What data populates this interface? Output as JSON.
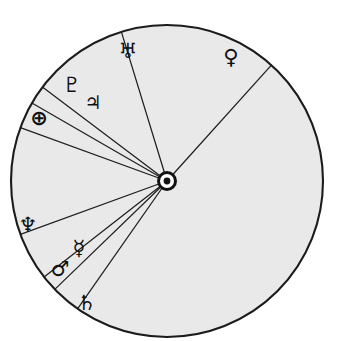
{
  "figure": {
    "hub_label": "Sun",
    "hub_symbol": "☉",
    "background_color": "#ffffff",
    "disc_fill_color": "#e9e9e9",
    "outline_color": "#1b1b1b",
    "glyph_color": "#101010"
  },
  "geometry": {
    "center_x": 167,
    "center_y": 181,
    "radius": 156,
    "units": "pixels"
  },
  "chart_data": {
    "type": "pie",
    "xlabel": "",
    "ylabel": "",
    "legend_position": "on-slice",
    "grid": false,
    "angle_units": "degrees-clockwise-from-top",
    "categories": [
      "Venus",
      "Uranus",
      "Pluto",
      "Jupiter",
      "Earth",
      "Neptune",
      "Mercury",
      "Mars",
      "Saturn"
    ],
    "symbols": [
      "♀",
      "♅",
      "♇",
      "♃",
      "⊕",
      "♆",
      "☿",
      "♂",
      "♄"
    ],
    "boundary_angles": [
      42,
      343,
      307,
      300,
      290,
      250,
      232,
      226,
      215
    ],
    "slices": [
      {
        "name": "Venus",
        "symbol": "♀",
        "start_angle": 42,
        "end_angle": 215,
        "sweep": 173,
        "value": 48.1
      },
      {
        "name": "Uranus",
        "symbol": "♅",
        "start_angle": 343,
        "end_angle": 42,
        "sweep": 59,
        "value": 16.4
      },
      {
        "name": "Pluto",
        "symbol": "♇",
        "start_angle": 307,
        "end_angle": 343,
        "sweep": 36,
        "value": 10.0
      },
      {
        "name": "Jupiter",
        "symbol": "♃",
        "start_angle": 300,
        "end_angle": 307,
        "sweep": 7,
        "value": 1.9
      },
      {
        "name": "Earth",
        "symbol": "⊕",
        "start_angle": 290,
        "end_angle": 300,
        "sweep": 10,
        "value": 2.8
      },
      {
        "name": "Neptune",
        "symbol": "♆",
        "start_angle": 250,
        "end_angle": 290,
        "sweep": 40,
        "value": 11.1
      },
      {
        "name": "Mercury",
        "symbol": "☿",
        "start_angle": 232,
        "end_angle": 250,
        "sweep": 18,
        "value": 5.0
      },
      {
        "name": "Mars",
        "symbol": "♂",
        "start_angle": 226,
        "end_angle": 232,
        "sweep": 6,
        "value": 1.7
      },
      {
        "name": "Saturn",
        "symbol": "♄",
        "start_angle": 215,
        "end_angle": 226,
        "sweep": 11,
        "value": 3.1
      }
    ]
  },
  "labels": [
    {
      "id": "uranus",
      "symbol": "♅",
      "name": "Uranus",
      "x": 128,
      "y": 52
    },
    {
      "id": "venus",
      "symbol": "♀",
      "name": "Venus",
      "x": 231,
      "y": 58
    },
    {
      "id": "pluto",
      "symbol": "♇",
      "name": "Pluto",
      "x": 72,
      "y": 86
    },
    {
      "id": "jupiter",
      "symbol": "♃",
      "name": "Jupiter",
      "x": 93,
      "y": 103
    },
    {
      "id": "earth",
      "symbol": "⊕",
      "name": "Earth",
      "x": 39,
      "y": 119
    },
    {
      "id": "neptune",
      "symbol": "♆",
      "name": "Neptune",
      "x": 28,
      "y": 226
    },
    {
      "id": "mercury",
      "symbol": "☿",
      "name": "Mercury",
      "x": 79,
      "y": 249
    },
    {
      "id": "mars",
      "symbol": "♂",
      "name": "Mars",
      "x": 60,
      "y": 270
    },
    {
      "id": "saturn",
      "symbol": "♄",
      "name": "Saturn",
      "x": 87,
      "y": 304
    }
  ]
}
